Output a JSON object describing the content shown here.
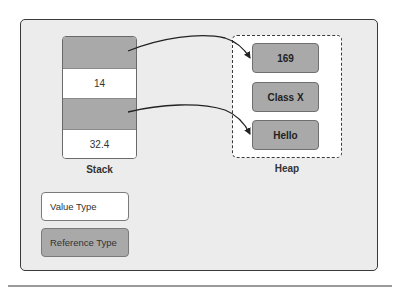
{
  "diagram": {
    "stack": {
      "label": "Stack",
      "segments": [
        {
          "type": "reference",
          "text": ""
        },
        {
          "type": "value",
          "text": "14"
        },
        {
          "type": "reference",
          "text": ""
        },
        {
          "type": "value",
          "text": "32.4"
        }
      ]
    },
    "heap": {
      "label": "Heap",
      "items": [
        {
          "text": "169"
        },
        {
          "text": "Class X"
        },
        {
          "text": "Hello"
        }
      ]
    },
    "arrows": [
      {
        "from": "stack.segments.0",
        "to": "heap.items.0"
      },
      {
        "from": "stack.segments.2",
        "to": "heap.items.2"
      }
    ],
    "legend": {
      "value_type": "Value Type",
      "reference_type": "Reference Type"
    },
    "colors": {
      "panel_bg": "#ececec",
      "reference_fill": "#a9a9a9",
      "value_fill": "#ffffff",
      "border": "#3a3a3a"
    }
  }
}
